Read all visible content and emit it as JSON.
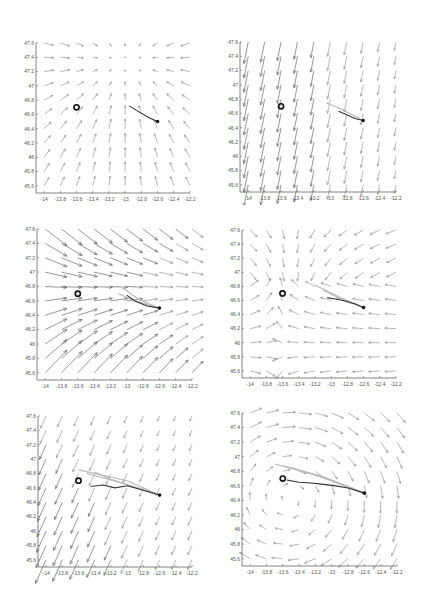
{
  "figure": {
    "layout": "3x2 grid of quiver plots",
    "colors": {
      "axis": "#666666",
      "arrow": "#9a9a9a",
      "arrow_strong": "#6a6a6a",
      "track": "#333333",
      "ensemble": "#b8b8b8",
      "marker": "#111111"
    }
  },
  "chart_data": [
    {
      "type": "quiver",
      "panel": "top-left",
      "title": "",
      "xlabel": "",
      "ylabel": "",
      "xlim": [
        -14.1,
        -12.2
      ],
      "ylim": [
        45.5,
        47.6
      ],
      "xticks": [
        "-14",
        "-13.8",
        "-13.6",
        "-13.4",
        "-13.2",
        "-13",
        "-12.8",
        "-12.6",
        "-12.4",
        "-12.2"
      ],
      "yticks": [
        "45.6",
        "45.8",
        "46",
        "46.2",
        "46.4",
        "46.6",
        "46.8",
        "47",
        "47.2",
        "47.4",
        "47.6"
      ],
      "field": "convergent",
      "field_params": {
        "cx": -13.0,
        "cy": 47.35,
        "strength": 0.7
      },
      "open_circle": [
        -13.6,
        46.7
      ],
      "filled_dot": [
        -12.6,
        46.5
      ],
      "track": [
        [
          -12.6,
          46.5
        ],
        [
          -12.7,
          46.55
        ],
        [
          -12.85,
          46.65
        ],
        [
          -12.95,
          46.72
        ]
      ],
      "ensemble": []
    },
    {
      "type": "quiver",
      "panel": "top-right",
      "title": "",
      "xlabel": "",
      "ylabel": "",
      "xlim": [
        -14.1,
        -12.2
      ],
      "ylim": [
        45.5,
        47.6
      ],
      "xticks": [
        "-14",
        "-13.8",
        "-13.6",
        "-13.4",
        "-13.2",
        "-13",
        "-12.8",
        "-12.6",
        "-12.4",
        "-12.2"
      ],
      "yticks": [
        "45.6",
        "45.8",
        "46",
        "46.2",
        "46.4",
        "46.6",
        "46.8",
        "47",
        "47.2",
        "47.4",
        "47.6"
      ],
      "field": "southward",
      "field_params": {
        "dx": -0.2,
        "dy": -1,
        "strength_west": 1.6,
        "strength_east": 0.6
      },
      "open_circle": [
        -13.6,
        46.7
      ],
      "filled_dot": [
        -12.6,
        46.5
      ],
      "track": [
        [
          -12.6,
          46.5
        ],
        [
          -12.7,
          46.53
        ],
        [
          -12.8,
          46.58
        ],
        [
          -12.9,
          46.63
        ]
      ],
      "ensemble": [
        [
          [
            -12.6,
            46.5
          ],
          [
            -12.9,
            46.68
          ],
          [
            -13.05,
            46.75
          ]
        ]
      ]
    },
    {
      "type": "quiver",
      "panel": "middle-left",
      "title": "",
      "xlabel": "",
      "ylabel": "",
      "xlim": [
        -14.1,
        -12.2
      ],
      "ylim": [
        45.5,
        47.6
      ],
      "xticks": [
        "-14",
        "-13.8",
        "-13.6",
        "-13.4",
        "-13.2",
        "-13",
        "-12.8",
        "-12.6",
        "-12.4",
        "-12.2"
      ],
      "yticks": [
        "45.6",
        "45.8",
        "46",
        "46.2",
        "46.4",
        "46.6",
        "46.8",
        "47",
        "47.2",
        "47.4",
        "47.6"
      ],
      "field": "eastward-converging",
      "field_params": {
        "cy": 46.75,
        "strength_west": 1.6,
        "strength_east": 0.8
      },
      "open_circle": [
        -13.6,
        46.7
      ],
      "filled_dot": [
        -12.6,
        46.5
      ],
      "track": [
        [
          -12.6,
          46.5
        ],
        [
          -12.75,
          46.53
        ],
        [
          -12.9,
          46.6
        ],
        [
          -13.0,
          46.68
        ]
      ],
      "ensemble": [
        [
          [
            -12.6,
            46.5
          ],
          [
            -12.85,
            46.62
          ],
          [
            -13.05,
            46.78
          ]
        ],
        [
          [
            -12.6,
            46.5
          ],
          [
            -12.9,
            46.6
          ],
          [
            -13.1,
            46.7
          ]
        ]
      ]
    },
    {
      "type": "quiver",
      "panel": "middle-right",
      "title": "",
      "xlabel": "",
      "ylabel": "",
      "xlim": [
        -14.1,
        -12.2
      ],
      "ylim": [
        45.5,
        47.6
      ],
      "xticks": [
        "-14",
        "-13.8",
        "-13.6",
        "-13.4",
        "-13.2",
        "-13",
        "-12.8",
        "-12.6",
        "-12.4",
        "-12.2"
      ],
      "yticks": [
        "45.6",
        "45.8",
        "46",
        "46.2",
        "46.4",
        "46.6",
        "46.8",
        "47",
        "47.2",
        "47.4",
        "47.6"
      ],
      "field": "saddle",
      "field_params": {
        "cx": -13.0,
        "cy": 46.9,
        "strength": 0.8
      },
      "open_circle": [
        -13.6,
        46.7
      ],
      "filled_dot": [
        -12.6,
        46.5
      ],
      "track": [
        [
          -12.6,
          46.5
        ],
        [
          -12.7,
          46.55
        ],
        [
          -12.85,
          46.6
        ],
        [
          -12.95,
          46.62
        ],
        [
          -13.05,
          46.64
        ]
      ],
      "ensemble": [
        [
          [
            -12.6,
            46.5
          ],
          [
            -12.9,
            46.65
          ],
          [
            -13.2,
            46.82
          ]
        ],
        [
          [
            -12.6,
            46.5
          ],
          [
            -12.85,
            46.6
          ],
          [
            -13.1,
            46.75
          ]
        ]
      ]
    },
    {
      "type": "quiver",
      "panel": "bottom-left",
      "title": "",
      "xlabel": "",
      "ylabel": "",
      "xlim": [
        -14.1,
        -12.2
      ],
      "ylim": [
        45.5,
        47.6
      ],
      "xticks": [
        "-14",
        "-13.8",
        "-13.6",
        "-13.4",
        "-13.2",
        "-13",
        "-12.8",
        "-12.6",
        "-12.4",
        "-12.2"
      ],
      "yticks": [
        "45.6",
        "45.8",
        "46",
        "46.2",
        "46.4",
        "46.6",
        "46.8",
        "47",
        "47.2",
        "47.4",
        "47.6"
      ],
      "field": "southwestward",
      "field_params": {
        "dx": -0.45,
        "dy": -1,
        "strength_west": 1.5,
        "strength_east": 0.6
      },
      "open_circle": [
        -13.6,
        46.7
      ],
      "filled_dot": [
        -12.6,
        46.5
      ],
      "track": [
        [
          -12.6,
          46.5
        ],
        [
          -12.75,
          46.55
        ],
        [
          -12.9,
          46.6
        ],
        [
          -13.0,
          46.63
        ],
        [
          -13.15,
          46.6
        ],
        [
          -13.3,
          46.64
        ],
        [
          -13.45,
          46.62
        ]
      ],
      "ensemble": [
        [
          [
            -12.6,
            46.5
          ],
          [
            -13.0,
            46.7
          ],
          [
            -13.6,
            46.85
          ]
        ],
        [
          [
            -12.6,
            46.5
          ],
          [
            -13.1,
            46.68
          ],
          [
            -13.5,
            46.8
          ]
        ],
        [
          [
            -12.6,
            46.5
          ],
          [
            -13.2,
            46.72
          ],
          [
            -13.4,
            46.82
          ]
        ]
      ]
    },
    {
      "type": "quiver",
      "panel": "bottom-right",
      "title": "",
      "xlabel": "",
      "ylabel": "",
      "xlim": [
        -14.1,
        -12.2
      ],
      "ylim": [
        45.5,
        47.6
      ],
      "xticks": [
        "-14",
        "-13.8",
        "-13.6",
        "-13.4",
        "-13.2",
        "-13",
        "-12.8",
        "-12.6",
        "-12.4",
        "-12.2"
      ],
      "yticks": [
        "45.6",
        "45.8",
        "46",
        "46.2",
        "46.4",
        "46.6",
        "46.8",
        "47",
        "47.2",
        "47.4",
        "47.6"
      ],
      "field": "vortex",
      "field_params": {
        "cx": -13.3,
        "cy": 46.2,
        "strength": 0.7
      },
      "open_circle": [
        -13.6,
        46.7
      ],
      "filled_dot": [
        -12.6,
        46.5
      ],
      "track": [
        [
          -12.6,
          46.5
        ],
        [
          -12.8,
          46.57
        ],
        [
          -12.95,
          46.6
        ],
        [
          -13.1,
          46.62
        ],
        [
          -13.25,
          46.64
        ],
        [
          -13.4,
          46.65
        ],
        [
          -13.55,
          46.68
        ]
      ],
      "ensemble": [
        [
          [
            -12.6,
            46.5
          ],
          [
            -13.1,
            46.72
          ],
          [
            -13.6,
            46.88
          ]
        ],
        [
          [
            -12.6,
            46.5
          ],
          [
            -13.0,
            46.68
          ],
          [
            -13.5,
            46.85
          ]
        ],
        [
          [
            -12.6,
            46.5
          ],
          [
            -13.2,
            46.75
          ],
          [
            -13.7,
            46.9
          ]
        ]
      ]
    }
  ]
}
